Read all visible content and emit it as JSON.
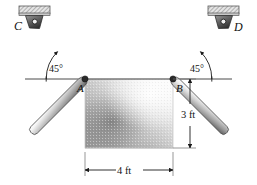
{
  "figure": {
    "background_color": "#ffffff",
    "line_color": "#1a1a1a",
    "width": 257,
    "height": 185
  },
  "labels": {
    "support_left": "C",
    "support_right": "D",
    "joint_left": "A",
    "joint_right": "B"
  },
  "angles": {
    "left": "45°",
    "right": "45°"
  },
  "dimensions": {
    "height": "3 ft",
    "width": "4 ft"
  },
  "geometry": {
    "point_a": {
      "x": 85,
      "y": 79
    },
    "point_b": {
      "x": 173,
      "y": 79
    },
    "point_c": {
      "x": 31,
      "y": 25
    },
    "point_d": {
      "x": 227,
      "y": 25
    },
    "block_left": 85,
    "block_right": 173,
    "block_top": 79,
    "block_bottom": 148,
    "ground_line_y": 79,
    "ground_line_x1": 25,
    "ground_line_x2": 232,
    "vert_dim_x": 190,
    "horiz_dim_y": 170
  },
  "colors": {
    "rod_light": "#f2f2f2",
    "rod_mid": "#b9b9b9",
    "rod_dark": "#5a5a5a",
    "bracket_fill": "#d9d9d9",
    "pin_dark": "#3a3a3a",
    "block_dark": "#6e6e6e",
    "block_light": "#fdfdfd",
    "ink": "#1a1a1a"
  },
  "icon_names": {
    "ceiling_bracket_left": "ceiling-bracket-icon",
    "ceiling_bracket_right": "ceiling-bracket-icon",
    "pin_left": "pin-joint-icon",
    "pin_right": "pin-joint-icon",
    "arrow_marker": "arrowhead-icon"
  }
}
